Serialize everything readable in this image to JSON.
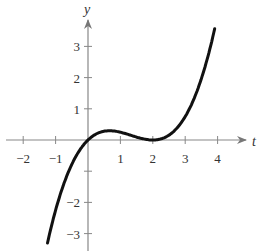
{
  "chart_data": {
    "type": "line",
    "title": "",
    "xlabel": "t",
    "ylabel": "y",
    "xlim": [
      -2.7,
      4.9
    ],
    "ylim": [
      -3.4,
      4.5
    ],
    "x_ticks": [
      "-2",
      "-1",
      "1",
      "2",
      "3",
      "4"
    ],
    "y_ticks": [
      "3",
      "2",
      "1",
      "-2",
      "-3"
    ],
    "grid": false,
    "legend": null,
    "series": [
      {
        "name": "y = t(t-2)^2/4",
        "x": [
          -1.25,
          -1.0,
          -0.75,
          -0.5,
          -0.25,
          0,
          0.25,
          0.5,
          0.667,
          1.0,
          1.25,
          1.5,
          1.75,
          2.0,
          2.25,
          2.5,
          2.75,
          3.0,
          3.25,
          3.5,
          3.75,
          3.9
        ],
        "y": [
          -3.3,
          -2.25,
          -1.42,
          -0.78,
          -0.32,
          0,
          0.19,
          0.28,
          0.3,
          0.25,
          0.18,
          0.09,
          0.03,
          0,
          0.04,
          0.16,
          0.39,
          0.75,
          1.27,
          1.97,
          2.87,
          3.52
        ]
      }
    ],
    "colors": {
      "curve": "#111111",
      "axes": "#777777"
    }
  }
}
